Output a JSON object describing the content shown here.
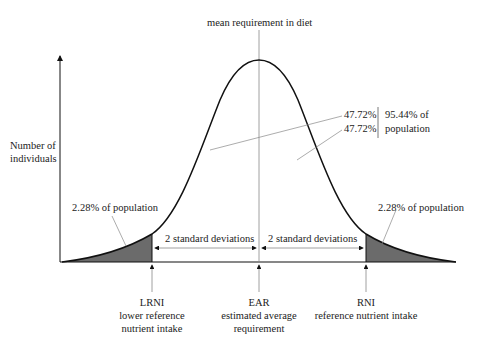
{
  "title": "mean requirement in diet",
  "y_axis_label": [
    "Number of",
    "individuals"
  ],
  "middle_annotation": {
    "upper_pct": "47.72%",
    "lower_pct": "47.72%",
    "total": "95.44% of",
    "total_2": "population"
  },
  "left_tail_label": "2.28% of population",
  "right_tail_label": "2.28% of population",
  "sd_left_label": "2 standard deviations",
  "sd_right_label": "2 standard deviations",
  "markers": [
    {
      "abbr": "LRNI",
      "line1": "lower reference",
      "line2": "nutrient intake"
    },
    {
      "abbr": "EAR",
      "line1": "estimated average",
      "line2": "requirement"
    },
    {
      "abbr": "RNI",
      "line1": "reference nutrient intake",
      "line2": ""
    }
  ],
  "colors": {
    "curve": "#111111",
    "shade": "#6b6b6b",
    "guide": "#888888"
  }
}
